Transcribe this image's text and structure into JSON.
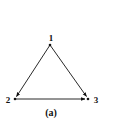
{
  "diagram": {
    "type": "directed-graph",
    "caption": "(a)",
    "nodes": [
      {
        "id": "1",
        "label": "1",
        "x": 50,
        "y": 45
      },
      {
        "id": "2",
        "label": "2",
        "x": 15,
        "y": 99
      },
      {
        "id": "3",
        "label": "3",
        "x": 88,
        "y": 99
      }
    ],
    "edges": [
      {
        "from": "1",
        "to": "2"
      },
      {
        "from": "1",
        "to": "3"
      },
      {
        "from": "2",
        "to": "3"
      }
    ],
    "colors": {
      "ink": "#111111",
      "background": "#ffffff"
    }
  }
}
